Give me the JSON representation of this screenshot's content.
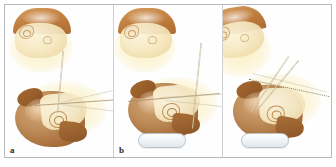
{
  "figure": {
    "type": "multi-panel-medical-illustration",
    "panel_count": 3,
    "border_color": "#b9b9bd",
    "background_color": "#ffffff"
  },
  "palette": {
    "scalp_brown": "#c4813f",
    "skull_brown": "#a9713d",
    "soft_tissue_cream": "#f4e7bf",
    "tissue_halo_yellow": "#faeeba",
    "headrest_gray": "#e0e6eb",
    "headrest_outline": "#b9c2ca",
    "instrument_line": "#96846 0",
    "label_color": "#2a2a2a"
  },
  "panels": [
    {
      "id": "panel-a",
      "label": "a",
      "upper_view": {
        "name": "superior-oblique-head",
        "description": "head with scalp flap and ear landmark"
      },
      "lower_view": {
        "name": "lateral-head",
        "description": "lateral skull with mastoid landmark"
      },
      "headrest_visible": false,
      "trajectories": [
        {
          "name": "vertical-reference-axis",
          "style": "solid"
        },
        {
          "name": "instrument-shaft",
          "style": "solid"
        },
        {
          "name": "angle-ray-upper",
          "style": "faint"
        },
        {
          "name": "angle-ray-lower",
          "style": "faint"
        }
      ]
    },
    {
      "id": "panel-b",
      "label": "b",
      "upper_view": {
        "name": "superior-oblique-head",
        "description": "head with scalp flap and ear landmark"
      },
      "lower_view": {
        "name": "lateral-head",
        "description": "lateral skull resting on headrest"
      },
      "headrest_visible": true,
      "trajectories": [
        {
          "name": "vertical-reference-axis",
          "style": "solid"
        },
        {
          "name": "instrument-shaft",
          "style": "solid"
        },
        {
          "name": "horizontal-ray",
          "style": "faint"
        },
        {
          "name": "angle-ray",
          "style": "faint"
        }
      ]
    },
    {
      "id": "panel-c",
      "label": "c",
      "upper_view": {
        "name": "rotated-head",
        "description": "head rotated showing cranial vault"
      },
      "lower_view": {
        "name": "lateral-head",
        "description": "lateral skull resting on headrest"
      },
      "headrest_visible": true,
      "trajectories": [
        {
          "name": "instrument-shaft-upper",
          "style": "solid"
        },
        {
          "name": "instrument-shaft-lower",
          "style": "solid"
        },
        {
          "name": "dotted-trajectory-line",
          "style": "dotted"
        },
        {
          "name": "angle-ray",
          "style": "faint"
        }
      ]
    }
  ]
}
